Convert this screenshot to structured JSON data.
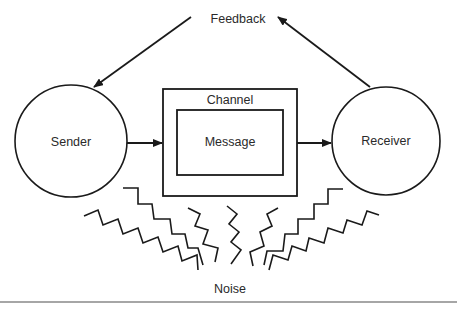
{
  "diagram": {
    "nodes": {
      "sender": "Sender",
      "receiver": "Receiver",
      "channel": "Channel",
      "message": "Message",
      "feedback": "Feedback",
      "noise": "Noise"
    },
    "edges": [
      {
        "from": "Sender",
        "to": "Channel"
      },
      {
        "from": "Channel",
        "to": "Receiver"
      },
      {
        "from": "Receiver",
        "to": "Feedback"
      },
      {
        "from": "Feedback",
        "to": "Sender"
      }
    ],
    "colors": {
      "stroke": "#1a1a1a",
      "text": "#2a2a2a",
      "rule": "#888888"
    }
  }
}
